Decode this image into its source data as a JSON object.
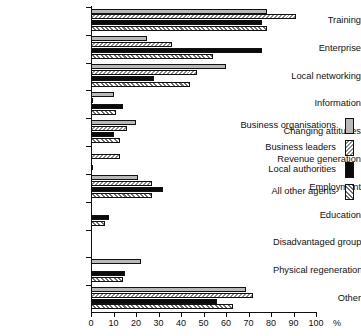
{
  "chart_data": {
    "type": "bar",
    "orientation": "horizontal",
    "title": "",
    "xlabel": "%",
    "ylabel": "",
    "xlim": [
      0,
      100
    ],
    "xticks": [
      0,
      10,
      20,
      30,
      40,
      50,
      60,
      70,
      80,
      90,
      100
    ],
    "grid": false,
    "legend_position": "center-right",
    "categories": [
      "Training",
      "Enterprise",
      "Local networking",
      "Information",
      "Changing attitudes",
      "Revenue generation",
      "Employment",
      "Education",
      "Disadvantaged groups",
      "Physical regeneration",
      "Other"
    ],
    "series": [
      {
        "name": "Business organisations",
        "pattern": "solid-light-gray",
        "color": "#b9b9b9",
        "values": [
          78,
          25,
          60,
          10,
          20,
          0,
          21,
          0,
          0,
          22,
          69
        ]
      },
      {
        "name": "Business leaders",
        "pattern": "hatch-backslash",
        "color": "#8f8f8f",
        "values": [
          91,
          36,
          47,
          1,
          16,
          13,
          27,
          0,
          0,
          0,
          72
        ]
      },
      {
        "name": "Local authorities",
        "pattern": "solid-black",
        "color": "#0a0a0a",
        "values": [
          76,
          76,
          28,
          14,
          10,
          0,
          32,
          8,
          0,
          15,
          56
        ]
      },
      {
        "name": "All other agents",
        "pattern": "hatch-slash",
        "color": "#6f6f6f",
        "values": [
          78,
          54,
          44,
          11,
          13,
          1,
          27,
          6,
          0,
          14,
          63
        ]
      }
    ]
  },
  "axis": {
    "x_unit": "%",
    "x_tick_labels": [
      "0",
      "10",
      "20",
      "30",
      "40",
      "50",
      "60",
      "70",
      "80",
      "90",
      "100"
    ]
  },
  "legend": {
    "entries": [
      "Business organisations",
      "Business leaders",
      "Local authorities",
      "All other agents"
    ]
  }
}
